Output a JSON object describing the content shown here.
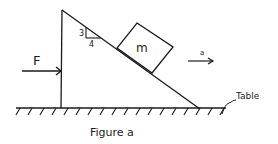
{
  "figure": {
    "caption": "Figure a",
    "labels": {
      "force": "F",
      "mass": "m",
      "acceleration": "a",
      "surface": "Table",
      "slope_rise": "3",
      "slope_run": "4"
    },
    "colors": {
      "ink": "#1a1a1a",
      "background": "#ffffff"
    }
  }
}
